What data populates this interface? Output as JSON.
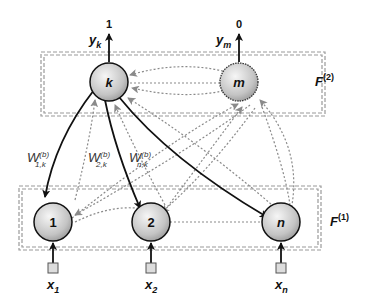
{
  "diagram": {
    "layers": [
      {
        "id": "F2",
        "label": "F",
        "superscript": "(2)"
      },
      {
        "id": "F1",
        "label": "F",
        "superscript": "(1)"
      }
    ],
    "output_nodes": [
      {
        "id": "k",
        "label": "k",
        "output_label": "y",
        "output_sub": "k",
        "output_value": "1",
        "active": true
      },
      {
        "id": "m",
        "label": "m",
        "output_label": "y",
        "output_sub": "m",
        "output_value": "0",
        "active": false
      }
    ],
    "input_nodes": [
      {
        "id": "1",
        "label": "1",
        "input_label": "x",
        "input_sub": "1"
      },
      {
        "id": "2",
        "label": "2",
        "input_label": "x",
        "input_sub": "2"
      },
      {
        "id": "n",
        "label": "n",
        "input_label": "x",
        "input_sub": "n"
      }
    ],
    "weights": [
      {
        "base": "W",
        "sup": "(b)",
        "sub": "1,k"
      },
      {
        "base": "W",
        "sup": "(b)",
        "sub": "2,k"
      },
      {
        "base": "W",
        "sup": "(b)",
        "sub": "n,k"
      }
    ],
    "colors": {
      "solid_edge": "#111111",
      "dotted_edge": "#8a8a8a",
      "layer_border": "#9a9a9a",
      "node_fill_light": "#f4f4f4",
      "node_fill_dark": "#9c9c9c"
    }
  }
}
